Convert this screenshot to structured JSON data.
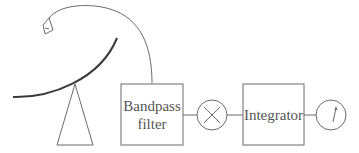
{
  "diagram": {
    "title": "",
    "nodes": [
      {
        "id": "dish",
        "type": "antenna",
        "label": ""
      },
      {
        "id": "feed-horn",
        "type": "feed",
        "label": ""
      },
      {
        "id": "bandpass",
        "type": "box",
        "label_line1": "Bandpass",
        "label_line2": "filter"
      },
      {
        "id": "multiplier",
        "type": "circle",
        "symbol": "×",
        "label": ""
      },
      {
        "id": "integrator",
        "type": "box",
        "label": "Integrator"
      },
      {
        "id": "meter",
        "type": "circle",
        "symbol": "needle",
        "label": ""
      }
    ],
    "edges": [
      {
        "from": "feed-horn",
        "to": "bandpass"
      },
      {
        "from": "bandpass",
        "to": "multiplier"
      },
      {
        "from": "multiplier",
        "to": "integrator"
      },
      {
        "from": "integrator",
        "to": "meter"
      }
    ],
    "colors": {
      "line": "#6b6b6b",
      "dish": "#3a3a3a",
      "text": "#555555",
      "background": "#ffffff"
    }
  }
}
